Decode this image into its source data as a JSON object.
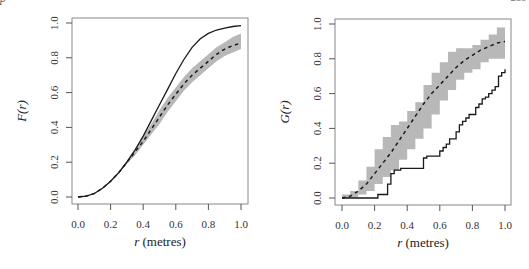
{
  "page": {
    "header_left": "p",
    "header_right": "259"
  },
  "style": {
    "band_color": "#b8b8b8",
    "line_color": "#1a1a1a",
    "frame_color": "#888888"
  },
  "chart_data": [
    {
      "id": "F",
      "type": "line",
      "title": "",
      "xlabel_italic": "r",
      "xlabel_rest": " (metres)",
      "ylabel": "F(r)",
      "xlim": [
        0,
        1
      ],
      "ylim": [
        0,
        1
      ],
      "xticks": [
        0.0,
        0.2,
        0.4,
        0.6,
        0.8,
        1.0
      ],
      "xtick_labels": [
        "0.0",
        "0.2",
        "0.4",
        "0.6",
        "0.8",
        "1.0"
      ],
      "yticks": [
        0.0,
        0.2,
        0.4,
        0.6,
        0.8,
        1.0
      ],
      "ytick_labels": [
        "0.0",
        "0.2",
        "0.4",
        "0.6",
        "0.8",
        "1.0"
      ],
      "grid": false,
      "legend": null,
      "x": [
        0.0,
        0.05,
        0.1,
        0.15,
        0.2,
        0.25,
        0.3,
        0.35,
        0.4,
        0.45,
        0.5,
        0.55,
        0.6,
        0.65,
        0.7,
        0.75,
        0.8,
        0.85,
        0.9,
        0.95,
        1.0
      ],
      "series": [
        {
          "name": "observed",
          "style": "solid",
          "values": [
            0.0,
            0.005,
            0.02,
            0.05,
            0.09,
            0.14,
            0.2,
            0.27,
            0.35,
            0.44,
            0.53,
            0.62,
            0.71,
            0.79,
            0.86,
            0.91,
            0.94,
            0.96,
            0.97,
            0.98,
            0.985
          ]
        },
        {
          "name": "theoretical mean",
          "style": "dashed",
          "values": [
            0.0,
            0.005,
            0.02,
            0.05,
            0.09,
            0.14,
            0.2,
            0.26,
            0.32,
            0.39,
            0.46,
            0.53,
            0.59,
            0.65,
            0.7,
            0.74,
            0.78,
            0.82,
            0.85,
            0.87,
            0.885
          ]
        },
        {
          "name": "envelope upper",
          "style": "band",
          "values": [
            0.0,
            0.005,
            0.021,
            0.052,
            0.094,
            0.146,
            0.21,
            0.28,
            0.35,
            0.42,
            0.5,
            0.57,
            0.63,
            0.69,
            0.74,
            0.78,
            0.82,
            0.86,
            0.89,
            0.92,
            0.94
          ]
        },
        {
          "name": "envelope lower",
          "style": "band",
          "values": [
            0.0,
            0.005,
            0.019,
            0.048,
            0.086,
            0.134,
            0.19,
            0.24,
            0.3,
            0.36,
            0.42,
            0.49,
            0.55,
            0.61,
            0.66,
            0.7,
            0.74,
            0.78,
            0.81,
            0.83,
            0.85
          ]
        }
      ]
    },
    {
      "id": "G",
      "type": "line",
      "title": "",
      "xlabel_italic": "r",
      "xlabel_rest": " (metres)",
      "ylabel": "G(r)",
      "xlim": [
        0,
        1
      ],
      "ylim": [
        0,
        1
      ],
      "xticks": [
        0.0,
        0.2,
        0.4,
        0.6,
        0.8,
        1.0
      ],
      "xtick_labels": [
        "0.0",
        "0.2",
        "0.4",
        "0.6",
        "0.8",
        "1.0"
      ],
      "yticks": [
        0.0,
        0.2,
        0.4,
        0.6,
        0.8,
        1.0
      ],
      "ytick_labels": [
        "0.0",
        "0.2",
        "0.4",
        "0.6",
        "0.8",
        "1.0"
      ],
      "grid": false,
      "legend": null,
      "step_observed": {
        "x": [
          0.0,
          0.22,
          0.28,
          0.3,
          0.32,
          0.36,
          0.5,
          0.52,
          0.6,
          0.62,
          0.64,
          0.66,
          0.7,
          0.72,
          0.74,
          0.76,
          0.78,
          0.82,
          0.84,
          0.86,
          0.88,
          0.9,
          0.92,
          0.94,
          0.96,
          0.98,
          1.0
        ],
        "y": [
          0.0,
          0.02,
          0.08,
          0.14,
          0.16,
          0.17,
          0.23,
          0.24,
          0.27,
          0.29,
          0.31,
          0.34,
          0.38,
          0.42,
          0.44,
          0.46,
          0.48,
          0.52,
          0.54,
          0.57,
          0.58,
          0.6,
          0.62,
          0.64,
          0.7,
          0.72,
          0.74
        ]
      },
      "x": [
        0.0,
        0.05,
        0.1,
        0.15,
        0.2,
        0.25,
        0.3,
        0.35,
        0.4,
        0.45,
        0.5,
        0.55,
        0.6,
        0.65,
        0.7,
        0.75,
        0.8,
        0.85,
        0.9,
        0.95,
        1.0
      ],
      "series": [
        {
          "name": "theoretical mean",
          "style": "dashed",
          "values": [
            0.0,
            0.01,
            0.04,
            0.08,
            0.14,
            0.2,
            0.26,
            0.33,
            0.4,
            0.47,
            0.54,
            0.6,
            0.65,
            0.7,
            0.75,
            0.79,
            0.82,
            0.85,
            0.87,
            0.89,
            0.9
          ]
        },
        {
          "name": "envelope upper",
          "style": "band",
          "values": [
            0.02,
            0.04,
            0.1,
            0.18,
            0.28,
            0.35,
            0.42,
            0.44,
            0.5,
            0.55,
            0.65,
            0.72,
            0.78,
            0.84,
            0.86,
            0.86,
            0.88,
            0.91,
            0.94,
            0.98,
            1.0
          ]
        },
        {
          "name": "envelope lower",
          "style": "band",
          "values": [
            0.0,
            0.0,
            0.0,
            0.02,
            0.04,
            0.08,
            0.12,
            0.16,
            0.22,
            0.28,
            0.34,
            0.4,
            0.48,
            0.56,
            0.62,
            0.68,
            0.72,
            0.74,
            0.78,
            0.8,
            0.8
          ]
        }
      ]
    }
  ]
}
